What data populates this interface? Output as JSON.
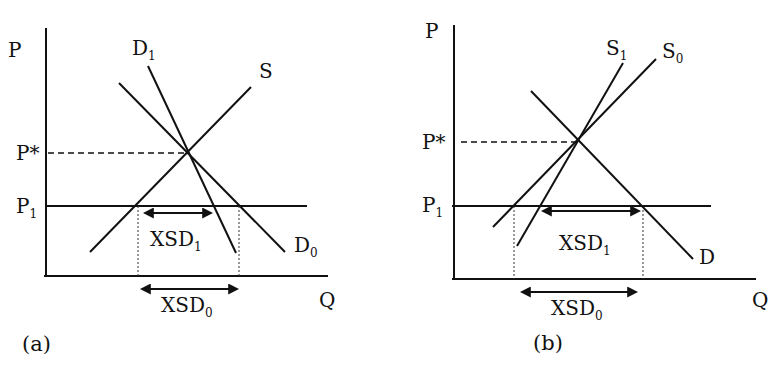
{
  "figure": {
    "panels": [
      {
        "id": "a",
        "caption": "(a)",
        "axes": {
          "y_label": "P",
          "x_label": "Q"
        },
        "price_labels": {
          "equilibrium": "P*",
          "world": "P",
          "world_sub": "1"
        },
        "curves": [
          {
            "name": "D",
            "sub": "1",
            "type": "demand"
          },
          {
            "name": "S",
            "sub": "",
            "type": "supply"
          },
          {
            "name": "D",
            "sub": "0",
            "type": "demand"
          }
        ],
        "annotations": [
          {
            "name": "XSD",
            "sub": "1"
          },
          {
            "name": "XSD",
            "sub": "0"
          }
        ]
      },
      {
        "id": "b",
        "caption": "(b)",
        "axes": {
          "y_label": "P",
          "x_label": "Q"
        },
        "price_labels": {
          "equilibrium": "P*",
          "world": "P",
          "world_sub": "1"
        },
        "curves": [
          {
            "name": "S",
            "sub": "1",
            "type": "supply"
          },
          {
            "name": "S",
            "sub": "0",
            "type": "supply"
          },
          {
            "name": "D",
            "sub": "",
            "type": "demand"
          }
        ],
        "annotations": [
          {
            "name": "XSD",
            "sub": "1"
          },
          {
            "name": "XSD",
            "sub": "0"
          }
        ]
      }
    ]
  }
}
